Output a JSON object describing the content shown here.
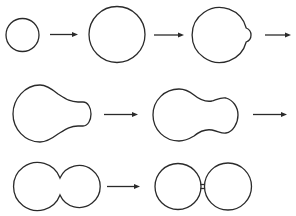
{
  "diagram": {
    "stroke_color": "#2a2a2a",
    "background": "#ffffff",
    "stages": [
      {
        "id": 1,
        "name": "small-cell",
        "description": "Small round cell"
      },
      {
        "id": 2,
        "name": "grown-cell",
        "description": "Enlarged round cell"
      },
      {
        "id": 3,
        "name": "budding-cell",
        "description": "Cell with small bud on right"
      },
      {
        "id": 4,
        "name": "bud-growing",
        "description": "Bud enlarging, bulb shape"
      },
      {
        "id": 5,
        "name": "bud-elongated",
        "description": "Peanut-shaped cell"
      },
      {
        "id": 6,
        "name": "constricting",
        "description": "Two lobes pinching together"
      },
      {
        "id": 7,
        "name": "separated",
        "description": "Two cells joined by narrow bridge"
      }
    ],
    "arrows": [
      {
        "from": 1,
        "to": 2
      },
      {
        "from": 2,
        "to": 3
      },
      {
        "from": 3,
        "to": 4
      },
      {
        "from": 4,
        "to": 5
      },
      {
        "from": 5,
        "to": 6
      },
      {
        "from": 6,
        "to": 7
      }
    ]
  }
}
